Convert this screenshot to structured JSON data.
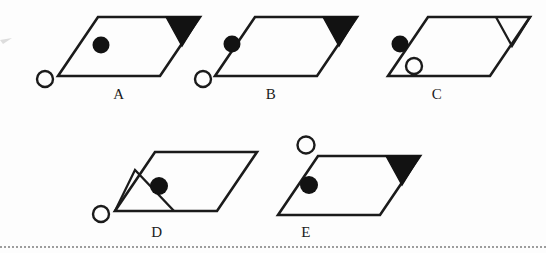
{
  "sheet": {
    "title": "Multiple-choice figure options row",
    "background_color": "#fdfdfd",
    "ink_color": "#1b1b1b",
    "fill_color": "#121212",
    "width": 546,
    "height": 253,
    "divider": {
      "name": "bottom-dotted-rule",
      "style": "dotted",
      "color": "#8d8d8d",
      "y": 246
    },
    "left_edge_mark": {
      "name": "left-edge-arrow-artifact",
      "color": "#9a9a9a",
      "x": 0,
      "y": 36
    }
  },
  "figures": [
    {
      "id": "A",
      "label": "A",
      "label_x": 119,
      "label_y": 86,
      "parallelogram": {
        "points": "98,17 200,17 160,76 58,76",
        "stroke": "#1b1b1b",
        "stroke_width": 2.6
      },
      "triangle": {
        "name": "corner-triangle",
        "position": "top-right",
        "points": "166,17 200,17 182,46",
        "filled": true,
        "fill": "#121212",
        "stroke": "#121212"
      },
      "filled_circle": {
        "cx": 101,
        "cy": 45,
        "r": 8.5,
        "filled": true,
        "inside_shape": true
      },
      "open_circle": {
        "cx": 45,
        "cy": 79,
        "r": 8.0,
        "filled": false,
        "inside_shape": false,
        "position": "outside-bottom-left-vertex"
      }
    },
    {
      "id": "B",
      "label": "B",
      "label_x": 271,
      "label_y": 86,
      "parallelogram": {
        "points": "255,17 357,17 317,76 215,76",
        "stroke": "#1b1b1b",
        "stroke_width": 2.6
      },
      "triangle": {
        "name": "corner-triangle",
        "position": "top-right",
        "points": "323,17 357,17 339,46",
        "filled": true,
        "fill": "#121212",
        "stroke": "#121212"
      },
      "filled_circle": {
        "cx": 232,
        "cy": 44,
        "r": 8.5,
        "filled": true,
        "inside_shape": false,
        "position": "outside-left-of-slant-edge"
      },
      "open_circle": {
        "cx": 203,
        "cy": 79,
        "r": 8.0,
        "filled": false,
        "inside_shape": false,
        "position": "outside-bottom-left-vertex"
      }
    },
    {
      "id": "C",
      "label": "C",
      "label_x": 437,
      "label_y": 86,
      "parallelogram": {
        "points": "428,17 530,17 490,76 388,76",
        "stroke": "#1b1b1b",
        "stroke_width": 2.6
      },
      "triangle": {
        "name": "corner-triangle",
        "position": "top-right",
        "points": "496,17 530,17 512,46",
        "filled": false,
        "fill": "none",
        "stroke": "#1b1b1b"
      },
      "filled_circle": {
        "cx": 400,
        "cy": 44,
        "r": 8.5,
        "filled": true,
        "inside_shape": false,
        "position": "outside-left-of-slant-edge"
      },
      "open_circle": {
        "cx": 414,
        "cy": 66,
        "r": 8.0,
        "filled": false,
        "inside_shape": true,
        "position": "inside-lower-left"
      }
    },
    {
      "id": "D",
      "label": "D",
      "label_x": 157,
      "label_y": 224,
      "parallelogram": {
        "points": "155,152 257,152 217,211 115,211",
        "stroke": "#1b1b1b",
        "stroke_width": 2.6
      },
      "triangle": {
        "name": "corner-triangle",
        "position": "bottom-left",
        "points": "115,211 174,211 135,170",
        "filled": false,
        "fill": "none",
        "stroke": "#1b1b1b"
      },
      "filled_circle": {
        "cx": 159,
        "cy": 186,
        "r": 9.0,
        "filled": true,
        "inside_shape": true
      },
      "open_circle": {
        "cx": 101,
        "cy": 214,
        "r": 8.0,
        "filled": false,
        "inside_shape": false,
        "position": "outside-bottom-left-vertex"
      }
    },
    {
      "id": "E",
      "label": "E",
      "label_x": 306,
      "label_y": 224,
      "parallelogram": {
        "points": "318,156 420,156 380,215 278,215",
        "stroke": "#1b1b1b",
        "stroke_width": 2.6
      },
      "triangle": {
        "name": "corner-triangle",
        "position": "top-right",
        "points": "386,156 420,156 402,185",
        "filled": true,
        "fill": "#121212",
        "stroke": "#121212"
      },
      "filled_circle": {
        "cx": 309,
        "cy": 185,
        "r": 9.0,
        "filled": true,
        "inside_shape": true
      },
      "open_circle": {
        "cx": 306,
        "cy": 145,
        "r": 8.5,
        "filled": false,
        "inside_shape": false,
        "position": "outside-above-top-edge"
      }
    }
  ]
}
